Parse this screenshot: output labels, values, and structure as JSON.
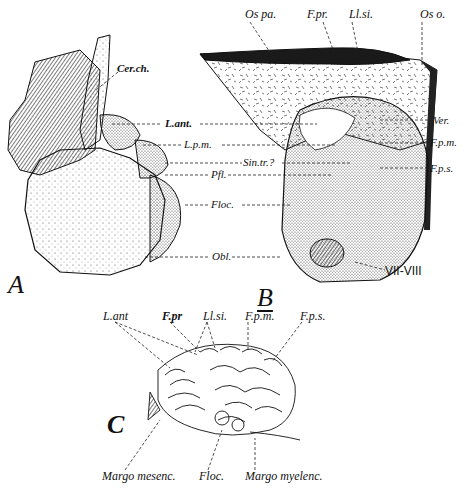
{
  "figure": {
    "panels": [
      {
        "id": "A",
        "label": "A"
      },
      {
        "id": "B",
        "label": "B"
      },
      {
        "id": "C",
        "label": "C"
      }
    ],
    "panel_A": {
      "labels": {
        "cer_ch": "Cer.ch."
      }
    },
    "shared_AB": {
      "labels": {
        "l_ant": "L.ant.",
        "l_pm": "L.p.m.",
        "sin_tr": "Sin.tr.?",
        "pfl": "Pfl.",
        "floc": "Floc.",
        "obl": "Obl."
      }
    },
    "panel_B": {
      "labels": {
        "os_pa": "Os pa.",
        "f_pr": "F.pr.",
        "ll_si": "Ll.si.",
        "os_o": "Os o.",
        "ver": "Ver.",
        "f_pm": "F.p.m.",
        "f_ps": "F.p.s.",
        "vii_viii": "VII-VIII"
      }
    },
    "panel_C": {
      "labels": {
        "l_ant": "L.ant",
        "f_pr": "F.pr",
        "ll_si": "Ll.si.",
        "f_pm": "F.p.m.",
        "f_ps": "F.p.s.",
        "margo_mesenc": "Margo mesenc.",
        "floc": "Floc.",
        "margo_myelenc": "Margo myelenc."
      }
    }
  }
}
